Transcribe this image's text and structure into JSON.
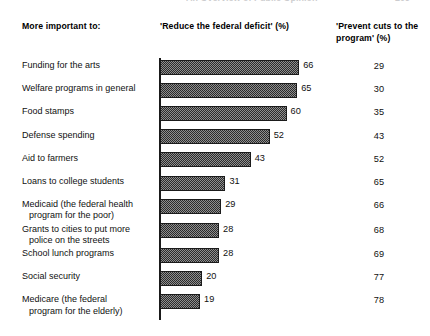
{
  "running_head": {
    "title": "An Overview of Public Opinion",
    "page_number": "209"
  },
  "header": {
    "left": "More important to:",
    "middle": "'Reduce the federal deficit' (%)",
    "right": "'Prevent cuts to the program' (%)"
  },
  "chart_data": {
    "type": "bar",
    "title": "More important to:",
    "xlabel": "",
    "ylabel": "",
    "xlim": [
      0,
      100
    ],
    "grid": false,
    "legend": "none",
    "orientation": "horizontal",
    "categories": [
      "Funding for the arts",
      "Welfare programs in general",
      "Food stamps",
      "Defense spending",
      "Aid to farmers",
      "Loans to college students",
      "Medicaid (the federal health program for the poor)",
      "Grants to cities to put more police on the streets",
      "School lunch programs",
      "Social security",
      "Medicare (the federal program for the elderly)"
    ],
    "category_lines": [
      [
        "Funding for the arts"
      ],
      [
        "Welfare programs in general"
      ],
      [
        "Food stamps"
      ],
      [
        "Defense spending"
      ],
      [
        "Aid to farmers"
      ],
      [
        "Loans to college students"
      ],
      [
        "Medicaid (the federal health",
        "program for the poor)"
      ],
      [
        "Grants to cities to put more",
        "police on the streets"
      ],
      [
        "School lunch programs"
      ],
      [
        "Social security"
      ],
      [
        "Medicare (the federal",
        "program for the elderly)"
      ]
    ],
    "series": [
      {
        "name": "'Reduce the federal deficit' (%)",
        "plotted": true,
        "values": [
          66,
          65,
          60,
          52,
          43,
          31,
          29,
          28,
          28,
          20,
          19
        ]
      },
      {
        "name": "'Prevent cuts to the program' (%)",
        "plotted": false,
        "values": [
          29,
          30,
          35,
          43,
          52,
          65,
          66,
          68,
          69,
          77,
          78
        ]
      }
    ]
  },
  "style": {
    "bar_fill": "#8e8e8e",
    "bar_pattern": "#2b2b2b",
    "bar_border": "#1b1b1b",
    "text": "#101010",
    "background": "#ffffff"
  }
}
